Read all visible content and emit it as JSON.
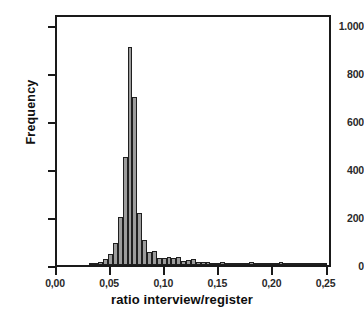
{
  "figure": {
    "cropped_top_text": "",
    "background_color": "#ffffff",
    "bar_fill_color": "#9c9c9c",
    "bar_border_color": "#1f1f1f",
    "axis_color": "#1a1a1a"
  },
  "chart_data": {
    "type": "bar",
    "chart_subtype": "histogram",
    "title": "",
    "xlabel": "ratio interview/register",
    "ylabel": "Frequency",
    "xlim": [
      0.0,
      0.255
    ],
    "ylim": [
      0,
      1050
    ],
    "grid": false,
    "legend": null,
    "bin_width": 0.0045,
    "xticks": [
      0.0,
      0.05,
      0.1,
      0.15,
      0.2,
      0.25
    ],
    "xtick_labels": [
      "0,00",
      "0,05",
      "0,10",
      "0,15",
      "0,20",
      "0,25"
    ],
    "yticks": [
      0,
      200,
      400,
      600,
      800,
      1000
    ],
    "ytick_labels": [
      "0",
      "200",
      "400",
      "600",
      "800",
      "1.000"
    ],
    "bins": [
      {
        "x": 0.0315,
        "value": 4
      },
      {
        "x": 0.036,
        "value": 6
      },
      {
        "x": 0.0405,
        "value": 14
      },
      {
        "x": 0.045,
        "value": 26
      },
      {
        "x": 0.0495,
        "value": 45
      },
      {
        "x": 0.054,
        "value": 92
      },
      {
        "x": 0.0585,
        "value": 200
      },
      {
        "x": 0.063,
        "value": 450
      },
      {
        "x": 0.0675,
        "value": 910
      },
      {
        "x": 0.072,
        "value": 700
      },
      {
        "x": 0.0765,
        "value": 215
      },
      {
        "x": 0.081,
        "value": 105
      },
      {
        "x": 0.0855,
        "value": 55
      },
      {
        "x": 0.09,
        "value": 58
      },
      {
        "x": 0.0945,
        "value": 30
      },
      {
        "x": 0.099,
        "value": 28
      },
      {
        "x": 0.1035,
        "value": 32
      },
      {
        "x": 0.108,
        "value": 30
      },
      {
        "x": 0.1125,
        "value": 34
      },
      {
        "x": 0.117,
        "value": 18
      },
      {
        "x": 0.1215,
        "value": 22
      },
      {
        "x": 0.126,
        "value": 24
      },
      {
        "x": 0.1305,
        "value": 14
      },
      {
        "x": 0.135,
        "value": 12
      },
      {
        "x": 0.1395,
        "value": 14
      },
      {
        "x": 0.144,
        "value": 8
      },
      {
        "x": 0.1485,
        "value": 10
      },
      {
        "x": 0.153,
        "value": 12
      },
      {
        "x": 0.1575,
        "value": 8
      },
      {
        "x": 0.162,
        "value": 6
      },
      {
        "x": 0.1665,
        "value": 10
      },
      {
        "x": 0.171,
        "value": 6
      },
      {
        "x": 0.1755,
        "value": 8
      },
      {
        "x": 0.18,
        "value": 12
      },
      {
        "x": 0.1845,
        "value": 5
      },
      {
        "x": 0.189,
        "value": 6
      },
      {
        "x": 0.1935,
        "value": 4
      },
      {
        "x": 0.198,
        "value": 7
      },
      {
        "x": 0.2025,
        "value": 5
      },
      {
        "x": 0.207,
        "value": 12
      },
      {
        "x": 0.2115,
        "value": 4
      },
      {
        "x": 0.216,
        "value": 3
      },
      {
        "x": 0.2205,
        "value": 4
      },
      {
        "x": 0.225,
        "value": 3
      },
      {
        "x": 0.2295,
        "value": 2
      },
      {
        "x": 0.234,
        "value": 6
      },
      {
        "x": 0.2385,
        "value": 2
      },
      {
        "x": 0.243,
        "value": 2
      },
      {
        "x": 0.2475,
        "value": 6
      }
    ]
  }
}
